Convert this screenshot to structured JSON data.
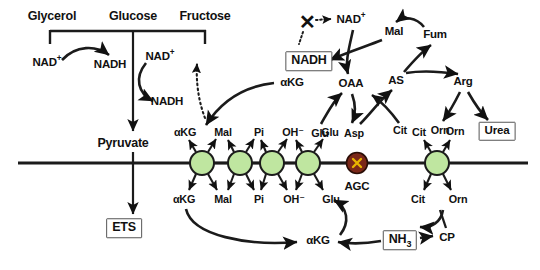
{
  "diagram": {
    "colors": {
      "transporter_fill": "#bfe6a0",
      "transporter_stroke": "#1b1b1b",
      "agc_fill": "#7a2718",
      "agc_x": "#e8b400",
      "membrane": "#1b1b1b",
      "text": "#111111",
      "box_border": "#555555"
    },
    "membrane": {
      "y": 163,
      "label": "inner-mitochondrial-membrane"
    }
  },
  "glycolysis": {
    "substrates": [
      {
        "id": "glycerol",
        "label": "Glycerol",
        "x": 52,
        "y": 16
      },
      {
        "id": "glucose",
        "label": "Glucose",
        "x": 133,
        "y": 16
      },
      {
        "id": "fructose",
        "label": "Fructose",
        "x": 205,
        "y": 16
      }
    ],
    "cofactors": [
      {
        "id": "nad-glycerol",
        "label": "NAD",
        "charge": "+",
        "x": 47,
        "y": 63
      },
      {
        "id": "nadh-glycerol",
        "label": "NADH",
        "charge": "",
        "x": 110,
        "y": 65
      },
      {
        "id": "nad-glucose",
        "label": "NAD",
        "charge": "+",
        "x": 160,
        "y": 57
      },
      {
        "id": "nadh-glucose",
        "label": "NADH",
        "charge": "",
        "x": 167,
        "y": 102
      }
    ],
    "products": [
      {
        "id": "pyruvate",
        "label": "Pyruvate",
        "x": 123,
        "y": 143
      },
      {
        "id": "ets",
        "label": "ETS",
        "x": 124,
        "y": 228,
        "boxed": true
      }
    ]
  },
  "transporters": [
    {
      "id": "akg-mal-carrier",
      "name": "oxoglutarate-carrier",
      "x": 202,
      "y": 163,
      "r": 12,
      "type": "green",
      "top_left": "αKG",
      "top_right": "Mal",
      "bottom_left": "αKG",
      "bottom_right": "Mal"
    },
    {
      "id": "mal-pi-carrier",
      "name": "dicarboxylate-carrier",
      "x": 240,
      "y": 163,
      "r": 12,
      "type": "green",
      "top_left": "Mal",
      "top_right": "Pi",
      "bottom_left": "Mal",
      "bottom_right": "Pi"
    },
    {
      "id": "pi-oh-carrier",
      "name": "phosphate-carrier",
      "x": 272,
      "y": 163,
      "r": 12,
      "type": "green",
      "top_left": "Pi",
      "top_right": "OH⁻",
      "bottom_left": "Pi",
      "bottom_right": "OH⁻"
    },
    {
      "id": "oh-glu-carrier",
      "name": "glutamate-carrier",
      "x": 308,
      "y": 163,
      "r": 12,
      "type": "green",
      "top_left": "OH⁻",
      "top_right": "Glu",
      "bottom_left": "OH⁻",
      "bottom_right": "Glu"
    },
    {
      "id": "agc-carrier",
      "name": "aspartate-glutamate-carrier",
      "x": 357,
      "y": 163,
      "r": 11,
      "type": "blocked",
      "label": "AGC",
      "label_x": 357,
      "label_y": 187,
      "glyph": "✕"
    },
    {
      "id": "cit-orn-carrier",
      "name": "ornithine-carrier",
      "x": 437,
      "y": 163,
      "r": 12,
      "type": "green",
      "top_left": "Cit",
      "top_right": "Orn",
      "bottom_left": "Cit",
      "bottom_right": "Orn"
    }
  ],
  "transporter_labels": [
    {
      "id": "t1-tl",
      "text": "αKG",
      "x": 185,
      "y": 132
    },
    {
      "id": "t1-tr",
      "text": "Mal",
      "x": 223,
      "y": 132
    },
    {
      "id": "t2-tr",
      "text": "Pi",
      "x": 259,
      "y": 132
    },
    {
      "id": "t3-tr",
      "text": "OH⁻",
      "x": 293,
      "y": 132
    },
    {
      "id": "t4-tr",
      "text": "Glu",
      "x": 330,
      "y": 132
    },
    {
      "id": "t1-bl",
      "text": "αKG",
      "x": 184,
      "y": 199
    },
    {
      "id": "t1-br",
      "text": "Mal",
      "x": 223,
      "y": 199
    },
    {
      "id": "t2-br",
      "text": "Pi",
      "x": 259,
      "y": 199
    },
    {
      "id": "t3-br",
      "text": "OH⁻",
      "x": 294,
      "y": 199
    },
    {
      "id": "t4-br",
      "text": "Glu",
      "x": 331,
      "y": 199
    },
    {
      "id": "t6-tl",
      "text": "Cit",
      "x": 419,
      "y": 132
    },
    {
      "id": "t6-tr",
      "text": "Orn",
      "x": 455,
      "y": 131
    },
    {
      "id": "t6-bl",
      "text": "Cit",
      "x": 418,
      "y": 199
    },
    {
      "id": "t6-br",
      "text": "Orn",
      "x": 458,
      "y": 199
    }
  ],
  "shuttle": {
    "nodes": [
      {
        "id": "x-inhibitor",
        "label": "✕",
        "x": 307,
        "y": 22,
        "kind": "xmark"
      },
      {
        "id": "nad-mito",
        "label": "NAD",
        "charge": "+",
        "x": 351,
        "y": 20
      },
      {
        "id": "nadh-mito",
        "label": "NADH",
        "x": 309,
        "y": 61,
        "boxed": true
      },
      {
        "id": "akg-mito",
        "label": "αKG",
        "x": 292,
        "y": 83
      },
      {
        "id": "oaa",
        "label": "OAA",
        "x": 351,
        "y": 84
      },
      {
        "id": "asp",
        "label": "Asp",
        "x": 354,
        "y": 133
      },
      {
        "id": "glu-mito",
        "label": "Glu",
        "x": 320,
        "y": 133
      },
      {
        "id": "akg-bottom",
        "label": "αKG",
        "x": 318,
        "y": 241
      }
    ]
  },
  "urea_cycle": {
    "nodes": [
      {
        "id": "mal",
        "label": "Mal",
        "x": 394,
        "y": 32
      },
      {
        "id": "fum",
        "label": "Fum",
        "x": 435,
        "y": 35
      },
      {
        "id": "as",
        "label": "AS",
        "x": 396,
        "y": 81
      },
      {
        "id": "arg",
        "label": "Arg",
        "x": 463,
        "y": 82
      },
      {
        "id": "cit",
        "label": "Cit",
        "x": 400,
        "y": 130
      },
      {
        "id": "orn",
        "label": "Orn",
        "x": 440,
        "y": 130
      },
      {
        "id": "urea",
        "label": "Urea",
        "x": 497,
        "y": 131,
        "boxed": true
      },
      {
        "id": "cp",
        "label": "CP",
        "x": 447,
        "y": 238
      },
      {
        "id": "nh3",
        "label": "NH",
        "sub": "3",
        "x": 400,
        "y": 240,
        "boxed": true
      }
    ]
  }
}
